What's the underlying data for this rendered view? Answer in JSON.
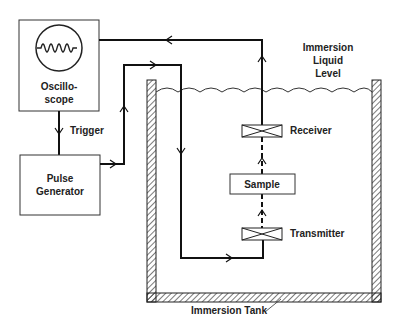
{
  "diagram": {
    "blocks": {
      "oscilloscope": {
        "label_line1": "Oscillo-",
        "label_line2": "scope"
      },
      "pulse_generator": {
        "label_line1": "Pulse",
        "label_line2": "Generator"
      },
      "sample": {
        "label": "Sample"
      }
    },
    "transducers": {
      "receiver": {
        "label": "Receiver"
      },
      "transmitter": {
        "label": "Transmitter"
      }
    },
    "annotations": {
      "trigger": "Trigger",
      "liquid_level_line1": "Immersion",
      "liquid_level_line2": "Liquid",
      "liquid_level_line3": "Level",
      "tank": "Immersion Tank"
    },
    "colors": {
      "stroke": "#1a1a1a",
      "background": "#ffffff"
    }
  }
}
